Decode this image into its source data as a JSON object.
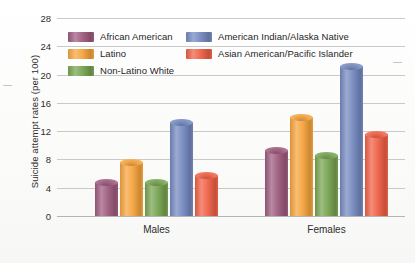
{
  "chart_data": {
    "type": "bar",
    "title": "",
    "xlabel": "",
    "ylabel": "Suicide attempt rates (per 100)",
    "categories": [
      "Males",
      "Females"
    ],
    "ylim": [
      0,
      28
    ],
    "yticks": [
      0,
      4,
      8,
      12,
      16,
      20,
      24,
      28
    ],
    "ytick_labels": [
      "0",
      "4",
      "8",
      "12",
      "16",
      "20",
      "24",
      "28"
    ],
    "grid": true,
    "legend_position": "top-inside",
    "series": [
      {
        "name": "African American",
        "color": "#9e5b7e",
        "values": [
          4.8,
          9.3
        ]
      },
      {
        "name": "Latino",
        "color": "#f5a33c",
        "values": [
          7.6,
          14.0
        ]
      },
      {
        "name": "Non-Latino White",
        "color": "#77a351",
        "values": [
          4.8,
          8.6
        ]
      },
      {
        "name": "American Indian/Alaska Native",
        "color": "#7489bf",
        "values": [
          13.3,
          21.2
        ]
      },
      {
        "name": "Asian American/Pacific Islander",
        "color": "#ef6046",
        "values": [
          5.8,
          11.6
        ]
      }
    ]
  },
  "legend": {
    "items": [
      {
        "label": "African American",
        "color": "#9e5b7e"
      },
      {
        "label": "Latino",
        "color": "#f5a33c"
      },
      {
        "label": "Non-Latino White",
        "color": "#77a351"
      },
      {
        "label": "American Indian/Alaska Native",
        "color": "#7489bf"
      },
      {
        "label": "Asian American/Pacific Islander",
        "color": "#ef6046"
      }
    ]
  },
  "axes": {
    "y_title": "Suicide attempt rates (per 100)",
    "x_labels": [
      "Males",
      "Females"
    ]
  },
  "marks": {
    "left_dash": "—",
    "right_dash": "—"
  }
}
